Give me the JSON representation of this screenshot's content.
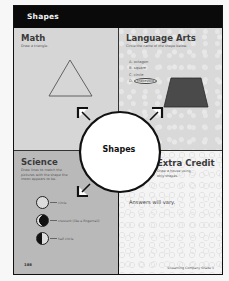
{
  "header": {
    "title": "Shapes"
  },
  "center": {
    "title": "Shapes"
  },
  "math": {
    "title": "Math",
    "instruction": "Draw a triangle."
  },
  "language_arts": {
    "title": "Language Arts",
    "instruction": "Circle the name of the shape below.",
    "options": [
      {
        "letter": "A.",
        "text": "octagon",
        "circled": false
      },
      {
        "letter": "B.",
        "text": "square",
        "circled": false
      },
      {
        "letter": "C.",
        "text": "circle",
        "circled": false
      },
      {
        "letter": "D.",
        "text": "trapezoid",
        "circled": true
      }
    ]
  },
  "science": {
    "title": "Science",
    "instruction": "Draw lines to match the pictures with the shape the moon appears to be.",
    "items": [
      {
        "phase": "full",
        "label": "circle"
      },
      {
        "phase": "crescent",
        "label": "crescent (like a fingernail)"
      },
      {
        "phase": "half",
        "label": "half circle"
      }
    ]
  },
  "extra_credit": {
    "title": "Extra Credit",
    "instruction": "Draw a house using only shapes.",
    "answer": "Answers will vary."
  },
  "footer": {
    "page_number": "188",
    "credit": "©Learning Company Grade 1"
  },
  "colors": {
    "header_bg": "#0a0a0a",
    "math_bg": "#d6d6d6",
    "science_bg": "#b9b9b9",
    "trapezoid_fill": "#4a4a4a"
  }
}
